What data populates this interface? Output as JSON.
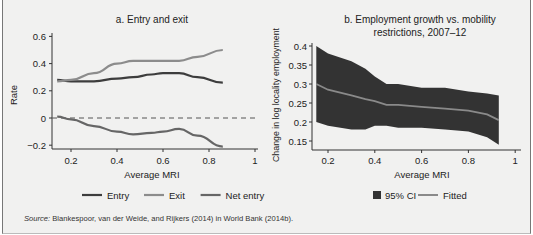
{
  "source": {
    "label": "Source:",
    "text": " Blankespoor, van der Weide, and Rijkers (2014) in World Bank (2014b)."
  },
  "colors": {
    "background": "#f1f1f0",
    "entry": "#3d3d3d",
    "exit": "#8c8c8c",
    "net_entry": "#666666",
    "ci_band": "#333333",
    "fitted": "#8a8a8a"
  },
  "chart_data": [
    {
      "type": "line",
      "title": "a. Entry and exit",
      "xlabel": "Average MRI",
      "ylabel": "Rate",
      "xlim": [
        0.12,
        1.0
      ],
      "ylim": [
        -0.25,
        0.62
      ],
      "xticks": [
        "0.2",
        "0.4",
        "0.6",
        "0.8",
        "1"
      ],
      "yticks": [
        "0.6",
        "0.4",
        "0.2",
        "0",
        "−0.2"
      ],
      "reference_line": {
        "y": 0,
        "style": "dashed"
      },
      "legend_position": "bottom",
      "x": [
        0.14,
        0.2,
        0.3,
        0.4,
        0.47,
        0.55,
        0.6,
        0.67,
        0.75,
        0.86
      ],
      "series": [
        {
          "name": "Entry",
          "values": [
            0.28,
            0.27,
            0.27,
            0.29,
            0.3,
            0.32,
            0.33,
            0.33,
            0.3,
            0.26
          ]
        },
        {
          "name": "Exit",
          "values": [
            0.27,
            0.28,
            0.33,
            0.4,
            0.42,
            0.42,
            0.42,
            0.42,
            0.45,
            0.5
          ]
        },
        {
          "name": "Net entry",
          "values": [
            0.01,
            -0.01,
            -0.06,
            -0.1,
            -0.12,
            -0.11,
            -0.1,
            -0.08,
            -0.13,
            -0.21
          ]
        }
      ]
    },
    {
      "type": "area",
      "title": "b. Employment growth vs. mobility restrictions, 2007–12",
      "xlabel": "Average MRI",
      "ylabel": "Change in log locality employment",
      "xlim": [
        0.12,
        1.0
      ],
      "ylim": [
        0.13,
        0.41
      ],
      "xticks": [
        "0.2",
        "0.4",
        "0.6",
        "0.8",
        "1"
      ],
      "yticks": [
        "0.4",
        "0.35",
        "0.3",
        "0.25",
        "0.2",
        "0.15"
      ],
      "legend_position": "bottom",
      "x": [
        0.15,
        0.2,
        0.3,
        0.36,
        0.4,
        0.45,
        0.5,
        0.6,
        0.7,
        0.8,
        0.88,
        0.93
      ],
      "series": [
        {
          "name": "95% CI upper",
          "values": [
            0.4,
            0.38,
            0.36,
            0.34,
            0.32,
            0.3,
            0.3,
            0.29,
            0.29,
            0.28,
            0.275,
            0.27
          ]
        },
        {
          "name": "95% CI lower",
          "values": [
            0.2,
            0.19,
            0.18,
            0.18,
            0.19,
            0.19,
            0.185,
            0.185,
            0.18,
            0.175,
            0.16,
            0.14
          ]
        },
        {
          "name": "Fitted",
          "values": [
            0.3,
            0.285,
            0.27,
            0.26,
            0.255,
            0.245,
            0.245,
            0.24,
            0.235,
            0.23,
            0.22,
            0.205
          ]
        }
      ],
      "legend": [
        "95% CI",
        "Fitted"
      ]
    }
  ]
}
